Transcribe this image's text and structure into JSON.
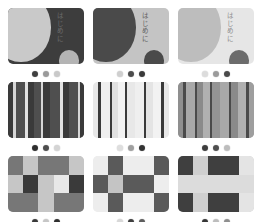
{
  "page": {
    "background": "#ffffff"
  },
  "grid": {
    "columns": 3,
    "rows": 3
  },
  "cards": [
    {
      "id": "palette-1",
      "pattern": "circles",
      "tile_background": "#3d3d3d",
      "shapes": {
        "big_circle": "#c9c9c9",
        "small_circle": "#b4b4b4"
      },
      "label": "はじめに",
      "label_color": "#6e6e6e",
      "swatches": [
        "#3f3f3f",
        "#9a9a9a",
        "#c9c9c9"
      ]
    },
    {
      "id": "palette-2",
      "pattern": "circles",
      "tile_background": "#c4c4c4",
      "shapes": {
        "big_circle": "#4a4a4a",
        "small_circle": "#4a4a4a"
      },
      "label": "はじめに",
      "label_color": "#5b5b5b",
      "swatches": [
        "#cfcfcf",
        "#4c4c4c",
        "#3a3a3a"
      ]
    },
    {
      "id": "palette-3",
      "pattern": "circles",
      "tile_background": "#e6e6e6",
      "shapes": {
        "big_circle": "#bdbdbd",
        "small_circle": "#6c6c6c"
      },
      "label": "はじめに",
      "label_color": "#8a8a8a",
      "swatches": [
        "#dcdcdc",
        "#9b9b9b",
        "#4a4a4a"
      ]
    },
    {
      "id": "palette-4",
      "pattern": "stripes",
      "tile_background": "#4a4a4a",
      "stripes": [
        {
          "color": "#3a3a3a",
          "width": 7
        },
        {
          "color": "#d6d6d6",
          "width": 3
        },
        {
          "color": "#4f4f4f",
          "width": 13
        },
        {
          "color": "#e2e2e2",
          "width": 3
        },
        {
          "color": "#3a3a3a",
          "width": 8
        },
        {
          "color": "#4f4f4f",
          "width": 9
        },
        {
          "color": "#d6d6d6",
          "width": 3
        },
        {
          "color": "#3a3a3a",
          "width": 10
        },
        {
          "color": "#4f4f4f",
          "width": 13
        },
        {
          "color": "#e2e2e2",
          "width": 3
        },
        {
          "color": "#3a3a3a",
          "width": 9
        },
        {
          "color": "#4f4f4f",
          "width": 11
        },
        {
          "color": "#d6d6d6",
          "width": 3
        },
        {
          "color": "#3a3a3a",
          "width": 5
        }
      ],
      "swatches": [
        "#2f2f2f",
        "#4e4e4e",
        "#d4d4d4"
      ]
    },
    {
      "id": "palette-5",
      "pattern": "stripes",
      "tile_background": "#ececec",
      "stripes": [
        {
          "color": "#e8e8e8",
          "width": 7
        },
        {
          "color": "#3a3a3a",
          "width": 3
        },
        {
          "color": "#efefef",
          "width": 12
        },
        {
          "color": "#3a3a3a",
          "width": 3
        },
        {
          "color": "#e0e0e0",
          "width": 8
        },
        {
          "color": "#f2f2f2",
          "width": 9
        },
        {
          "color": "#3a3a3a",
          "width": 3
        },
        {
          "color": "#e8e8e8",
          "width": 10
        },
        {
          "color": "#efefef",
          "width": 12
        },
        {
          "color": "#3a3a3a",
          "width": 3
        },
        {
          "color": "#e4e4e4",
          "width": 9
        },
        {
          "color": "#f2f2f2",
          "width": 11
        },
        {
          "color": "#3a3a3a",
          "width": 3
        },
        {
          "color": "#e8e8e8",
          "width": 7
        }
      ],
      "swatches": [
        "#dedede",
        "#a0a0a0",
        "#333333"
      ]
    },
    {
      "id": "palette-6",
      "pattern": "stripes",
      "tile_background": "#9e9e9e",
      "stripes": [
        {
          "color": "#8f8f8f",
          "width": 7
        },
        {
          "color": "#4a4a4a",
          "width": 3
        },
        {
          "color": "#a8a8a8",
          "width": 12
        },
        {
          "color": "#4a4a4a",
          "width": 3
        },
        {
          "color": "#8a8a8a",
          "width": 8
        },
        {
          "color": "#b0b0b0",
          "width": 9
        },
        {
          "color": "#4a4a4a",
          "width": 3
        },
        {
          "color": "#949494",
          "width": 10
        },
        {
          "color": "#a8a8a8",
          "width": 12
        },
        {
          "color": "#4a4a4a",
          "width": 3
        },
        {
          "color": "#8a8a8a",
          "width": 9
        },
        {
          "color": "#b0b0b0",
          "width": 11
        },
        {
          "color": "#4a4a4a",
          "width": 3
        },
        {
          "color": "#9e9e9e",
          "width": 7
        }
      ],
      "swatches": [
        "#3e3e3e",
        "#4f4f4f",
        "#bdbdbd"
      ]
    },
    {
      "id": "palette-7",
      "pattern": "checks",
      "tile_background": "#c6c6c6",
      "cells": [
        "#777777",
        "#c6c6c6",
        "#777777",
        "#777777",
        "#c6c6c6",
        "#c6c6c6",
        "#3a3a3a",
        "#c6c6c6",
        "#e8e8e8",
        "#3a3a3a",
        "#777777",
        "#777777",
        "#c6c6c6",
        "#777777",
        "#777777"
      ],
      "swatches": [
        "#3a3a3a",
        "#c6c6c6",
        "#2f2f2f"
      ]
    },
    {
      "id": "palette-8",
      "pattern": "checks",
      "tile_background": "#ededed",
      "cells": [
        "#ededed",
        "#5a5a5a",
        "#ededed",
        "#ededed",
        "#5a5a5a",
        "#5a5a5a",
        "#c4c4c4",
        "#5a5a5a",
        "#5a5a5a",
        "#ededed",
        "#ededed",
        "#5a5a5a",
        "#ededed",
        "#ededed",
        "#5a5a5a"
      ],
      "swatches": [
        "#d8d8d8",
        "#3f3f3f",
        "#5e5e5e"
      ]
    },
    {
      "id": "palette-9",
      "pattern": "checks",
      "tile_background": "#cfcfcf",
      "cells": [
        "#3f3f3f",
        "#cfcfcf",
        "#3f3f3f",
        "#3f3f3f",
        "#e4e4e4",
        "#dcdcdc",
        "#dcdcdc",
        "#dcdcdc",
        "#dcdcdc",
        "#dcdcdc",
        "#3f3f3f",
        "#cfcfcf",
        "#3f3f3f",
        "#3f3f3f",
        "#e4e4e4"
      ],
      "swatches": [
        "#363636",
        "#bdbdbd",
        "#8f8f8f"
      ]
    }
  ]
}
